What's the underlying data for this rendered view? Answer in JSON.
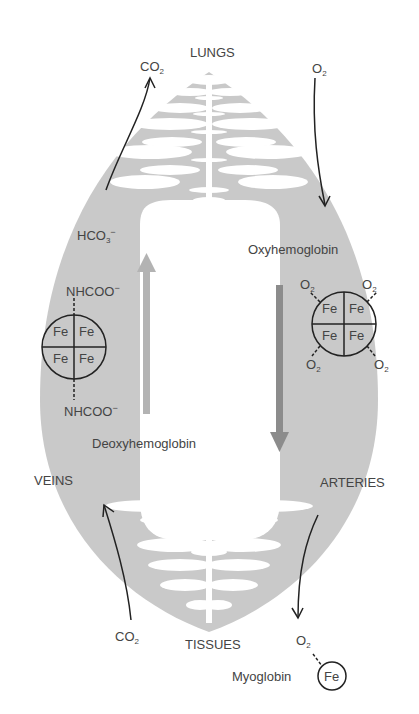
{
  "colors": {
    "body": "#c8c8c8",
    "arrow_up": "#b0b0b0",
    "arrow_down": "#8a8a8a",
    "ink": "#222222"
  },
  "labels": {
    "lungs": "LUNGS",
    "tissues": "TISSUES",
    "veins": "VEINS",
    "arteries": "ARTERIES",
    "co2_top": "CO",
    "o2_top": "O",
    "hco3": "HCO",
    "oxyhemoglobin": "Oxyhemoglobin",
    "deoxyhemoglobin": "Deoxyhemoglobin",
    "nhcoo_top": "NHCOO",
    "nhcoo_bottom": "NHCOO",
    "co2_bottom": "CO",
    "o2_bottom": "O",
    "myoglobin": "Myoglobin",
    "fe": "Fe",
    "sub2": "2",
    "sub3": "3",
    "minus": "−"
  },
  "deoxy_subunits": [
    "Fe",
    "Fe",
    "Fe",
    "Fe"
  ],
  "oxy_subunits": [
    "Fe",
    "Fe",
    "Fe",
    "Fe"
  ],
  "oxy_ligands": [
    "O2",
    "O2",
    "O2",
    "O2"
  ]
}
